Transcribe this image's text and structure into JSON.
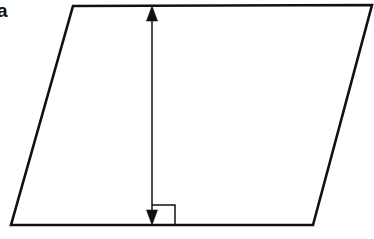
{
  "figure": {
    "kind": "geometry-diagram",
    "shape_name": "parallelogram",
    "part_label": "a",
    "background_color": "#ffffff",
    "stroke_color": "#111111",
    "canvas": {
      "width": 374,
      "height": 239
    },
    "parallelogram": {
      "stroke_width": 2.6,
      "fill": "none",
      "points": "73,6 372,5 313,225 11,225",
      "vertices": [
        {
          "name": "top-left",
          "x": 73,
          "y": 6
        },
        {
          "name": "top-right",
          "x": 372,
          "y": 5
        },
        {
          "name": "bottom-right",
          "x": 313,
          "y": 225
        },
        {
          "name": "bottom-left",
          "x": 11,
          "y": 225
        }
      ]
    },
    "height_arrow": {
      "label": "",
      "stroke_width": 1.5,
      "x": 152,
      "y_top": 8,
      "y_bottom": 223,
      "head_half_width": 5.5,
      "head_length": 15,
      "top_head_points": "152,6 146.5,21 157.5,21",
      "bottom_head_points": "152,225 146.5,210 157.5,210"
    },
    "right_angle_marker": {
      "stroke_width": 1.5,
      "x_left": 152,
      "x_right": 175,
      "y_top": 205,
      "y_bottom": 225,
      "path": "M 152 205 L 175 205 L 175 225"
    }
  }
}
